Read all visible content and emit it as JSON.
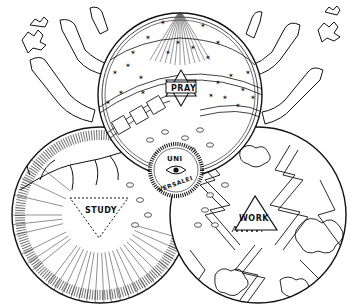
{
  "figure": {
    "type": "engraving-style symbolic diagram",
    "background": "#ffffff",
    "ink_color": "#111111",
    "circles": [
      {
        "id": "pray",
        "label": "PRAY",
        "position": "top",
        "symbol": "hexagram",
        "theme": "starry sky"
      },
      {
        "id": "study",
        "label": "STUDY",
        "position": "bottom-left",
        "symbol": "inverted dashed triangle",
        "theme": "radiating light rays, branches"
      },
      {
        "id": "work",
        "label": "WORK",
        "position": "bottom-right",
        "symbol": "upward triangle",
        "theme": "lightning bolts, clouds"
      }
    ],
    "center_medallion": {
      "text_top": "UNI",
      "text_bottom": "VERSALEI",
      "symbol": "eye"
    },
    "decorations": [
      "arms reaching from sides",
      "grape leaves",
      "falling seeds/leaves between circles"
    ]
  },
  "labels": {
    "pray": "PRAY",
    "study": "STUDY",
    "work": "WORK",
    "uni": "UNI",
    "versalei": "VERSALEI"
  }
}
